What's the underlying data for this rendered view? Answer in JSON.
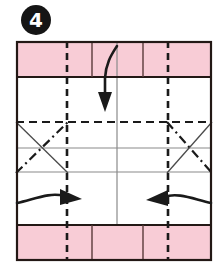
{
  "step": {
    "number": "4",
    "badge_shape": "filled-circle",
    "badge_color": "#151515",
    "badge_text_color": "#ffffff"
  },
  "diagram": {
    "kind": "origami-fold-instruction",
    "paper": {
      "fill": "#ffffff",
      "border_color": "#231815",
      "border_width": 2,
      "x": 16,
      "y": 41,
      "width": 196,
      "height": 220
    },
    "bands": [
      {
        "name": "top-colored-band",
        "fill": "#f8ccd6",
        "x": 16,
        "y": 41,
        "width": 196,
        "height": 36
      },
      {
        "name": "bottom-colored-band",
        "fill": "#f8ccd6",
        "x": 16,
        "y": 225,
        "width": 196,
        "height": 36
      }
    ],
    "crease_lines": {
      "vertical_valley_dashed": [
        {
          "name": "left-valley-crease",
          "x": 67
        },
        {
          "name": "right-valley-crease",
          "x": 168
        }
      ],
      "vertical_solid": [
        {
          "name": "left-inner-edge",
          "x": 92,
          "y1": 41,
          "y2": 77
        },
        {
          "name": "center-edge",
          "x": 117,
          "y1": 41,
          "y2": 225
        },
        {
          "name": "right-inner-edge",
          "x": 143,
          "y1": 41,
          "y2": 77
        },
        {
          "name": "left-inner-edge-bottom",
          "x": 92,
          "y1": 225,
          "y2": 261
        },
        {
          "name": "right-inner-edge-bottom",
          "x": 143,
          "y1": 225,
          "y2": 261
        }
      ],
      "horizontal_solid": [
        {
          "name": "band-edge-top",
          "y": 77
        },
        {
          "name": "mid-crease-upper",
          "y": 148
        },
        {
          "name": "mid-crease-lower",
          "y": 172
        },
        {
          "name": "band-edge-bottom",
          "y": 225
        }
      ],
      "horizontal_dashed": [
        {
          "name": "upper-valley-crease",
          "y": 122
        }
      ],
      "diagonals": [
        {
          "name": "left-x-solid",
          "style": "solid",
          "x1": 16,
          "y1": 122,
          "x2": 67,
          "y2": 172
        },
        {
          "name": "left-x-dashdot",
          "style": "dash-dot",
          "x1": 16,
          "y1": 172,
          "x2": 67,
          "y2": 122
        },
        {
          "name": "right-x-dashdot",
          "style": "dash-dot",
          "x1": 168,
          "y1": 122,
          "x2": 212,
          "y2": 172
        },
        {
          "name": "right-x-solid",
          "style": "solid",
          "x1": 168,
          "y1": 172,
          "x2": 212,
          "y2": 122
        }
      ]
    },
    "arrows": [
      {
        "name": "fold-down-arrow",
        "direction": "down",
        "shape": "curved-hook-then-straight",
        "color": "#1a1a1a"
      },
      {
        "name": "fold-right-arrow",
        "direction": "right",
        "shape": "curved",
        "color": "#1a1a1a"
      },
      {
        "name": "fold-left-arrow",
        "direction": "left",
        "shape": "curved",
        "color": "#1a1a1a"
      }
    ],
    "colors": {
      "paper_front": "#ffffff",
      "paper_back": "#f8ccd6",
      "outline": "#231815",
      "crease_gray": "#8a8a8a",
      "arrow": "#1a1a1a"
    }
  }
}
